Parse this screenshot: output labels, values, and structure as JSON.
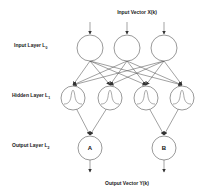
{
  "diagram": {
    "title_top": "Input Vector X(k)",
    "title_bottom": "Output Vector Y(k)",
    "layers": [
      {
        "label": "Input Layer L",
        "sub": "0"
      },
      {
        "label": "Hidden Layer L",
        "sub": "1"
      },
      {
        "label": "Output Layer L",
        "sub": "2"
      }
    ],
    "output_nodes": [
      {
        "label": "A"
      },
      {
        "label": "B"
      }
    ],
    "colors": {
      "stroke": "#555555",
      "text": "#222222",
      "background": "#ffffff"
    }
  }
}
